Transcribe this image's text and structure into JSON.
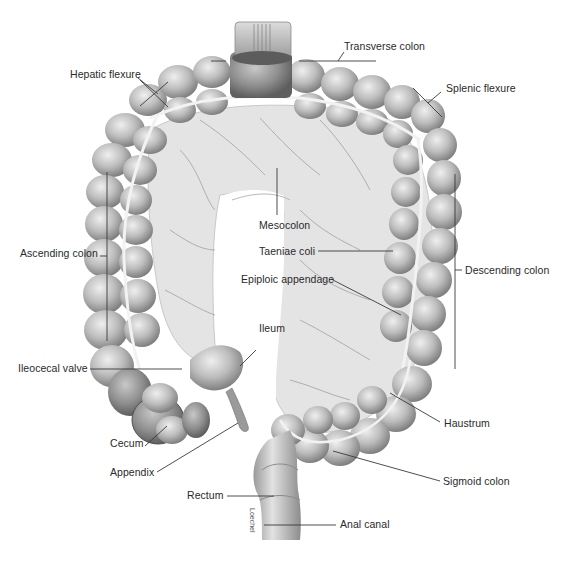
{
  "figure": {
    "type": "anatomical-illustration",
    "palette": {
      "background": "#ffffff",
      "tissue_light": "#d9d9d9",
      "tissue_mid": "#b4b4b4",
      "tissue_dark": "#7a7a7a",
      "mesentery": "#e6e6e6",
      "vessel": "#f4f4f4",
      "leader_line": "#3a3a3a",
      "label_text": "#2a2a2a"
    }
  },
  "labels": {
    "transverse_colon": "Transverse colon",
    "hepatic_flexure": "Hepatic flexure",
    "splenic_flexure": "Splenic flexure",
    "mesocolon": "Mesocolon",
    "ascending_colon": "Ascending colon",
    "taeniae_coli": "Taeniae coli",
    "descending_colon": "Descending colon",
    "epiploic_appendage": "Epiploic appendage",
    "ileum": "Ileum",
    "ileocecal_valve": "Ileocecal valve",
    "haustrum": "Haustrum",
    "cecum": "Cecum",
    "appendix": "Appendix",
    "sigmoid_colon": "Sigmoid colon",
    "rectum": "Rectum",
    "anal_canal": "Anal canal"
  },
  "credit": "Loechel"
}
